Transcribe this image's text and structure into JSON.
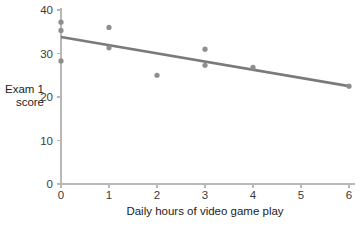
{
  "chart_data": {
    "type": "scatter",
    "title": "",
    "subtitle": "",
    "xlabel": "Daily hours of video game play",
    "ylabel": "Exam 1 score",
    "ylabel_lines": [
      "Exam 1",
      "score"
    ],
    "xlim": [
      0,
      6
    ],
    "ylim": [
      0,
      40
    ],
    "xticks": [
      0,
      1,
      2,
      3,
      4,
      5,
      6
    ],
    "xtick_labels": [
      "0",
      "1",
      "2",
      "3",
      "4",
      "5",
      "6"
    ],
    "yticks": [
      0,
      10,
      20,
      30,
      40
    ],
    "ytick_labels": [
      "0",
      "10",
      "20",
      "30",
      "40"
    ],
    "grid": false,
    "legend": false,
    "legend_position": "none",
    "series": [
      {
        "name": "observations",
        "type": "scatter",
        "marker": "circle",
        "color": "#8e8e8e",
        "points": [
          {
            "x": 0,
            "y": 37.2
          },
          {
            "x": 0,
            "y": 35.3
          },
          {
            "x": 0,
            "y": 28.3
          },
          {
            "x": 1,
            "y": 36.0
          },
          {
            "x": 1,
            "y": 31.3
          },
          {
            "x": 2,
            "y": 25.0
          },
          {
            "x": 3,
            "y": 31.0
          },
          {
            "x": 3,
            "y": 27.3
          },
          {
            "x": 4,
            "y": 26.8
          },
          {
            "x": 6,
            "y": 22.5
          }
        ]
      },
      {
        "name": "regression-line",
        "type": "line",
        "color": "#7a7a7a",
        "points": [
          {
            "x": 0,
            "y": 33.8
          },
          {
            "x": 6,
            "y": 22.5
          }
        ]
      }
    ],
    "colors": {
      "axis": "#b8b8b8",
      "tick_label": "#3b3b3b",
      "axis_title": "#222222",
      "marker": "#8e8e8e",
      "trend_line": "#7a7a7a",
      "background": "#ffffff"
    },
    "geometry": {
      "x0_px": 61,
      "x_unit_px": 48,
      "y0_px": 184,
      "y_unit_px": 4.35,
      "marker_radius_px": 2.6,
      "line_width_px": 2.6,
      "axis_width_px": 1.1,
      "tick_len_px": 4
    }
  }
}
